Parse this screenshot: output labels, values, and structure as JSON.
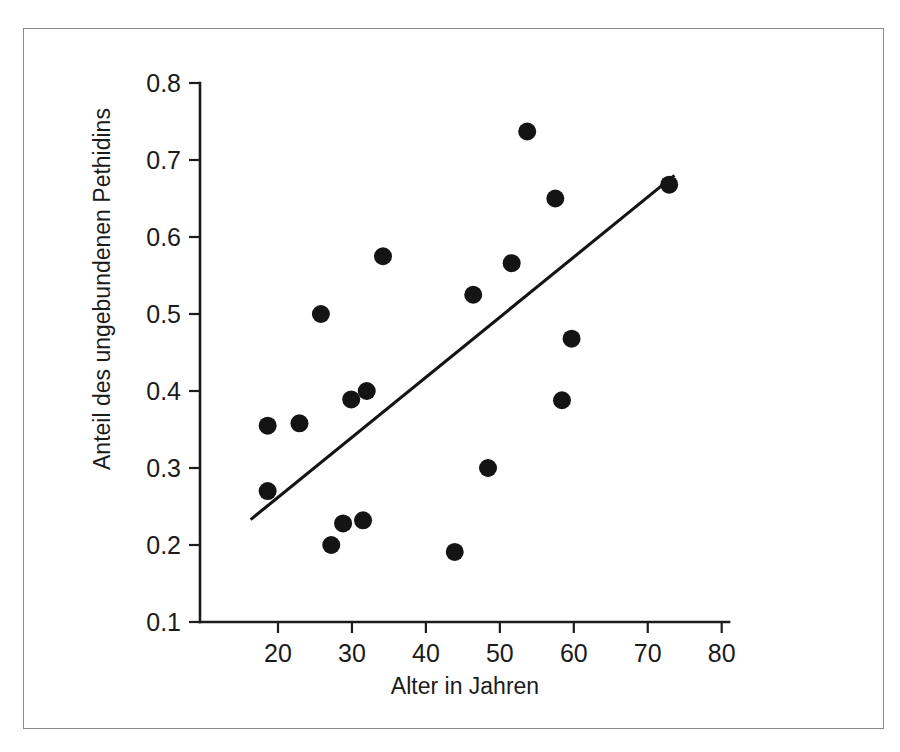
{
  "figure": {
    "border_color": "#8a8a8a",
    "background": "#ffffff"
  },
  "chart_data": {
    "type": "scatter",
    "title": "",
    "xlabel": "Alter in Jahren",
    "ylabel": "Anteil des ungebundenen Pethidins",
    "xlim": [
      13,
      81
    ],
    "ylim": [
      0.1,
      0.8
    ],
    "xticks": [
      20,
      30,
      40,
      50,
      60,
      70,
      80
    ],
    "xtick_labels": [
      "20",
      "30",
      "40",
      "50",
      "60",
      "70",
      "80"
    ],
    "yticks": [
      0.1,
      0.2,
      0.3,
      0.4,
      0.5,
      0.6,
      0.7,
      0.8
    ],
    "ytick_labels": [
      "0.1",
      "0.2",
      "0.3",
      "0.4",
      "0.5",
      "0.6",
      "0.7",
      "0.8"
    ],
    "grid": false,
    "legend": false,
    "marker_color": "#141414",
    "marker_size": 9,
    "points": [
      {
        "x": 18.6,
        "y": 0.355
      },
      {
        "x": 18.6,
        "y": 0.27
      },
      {
        "x": 22.9,
        "y": 0.358
      },
      {
        "x": 25.8,
        "y": 0.5
      },
      {
        "x": 27.2,
        "y": 0.2
      },
      {
        "x": 28.8,
        "y": 0.228
      },
      {
        "x": 29.9,
        "y": 0.389
      },
      {
        "x": 31.5,
        "y": 0.232
      },
      {
        "x": 32.0,
        "y": 0.4
      },
      {
        "x": 34.2,
        "y": 0.575
      },
      {
        "x": 43.9,
        "y": 0.191
      },
      {
        "x": 46.4,
        "y": 0.525
      },
      {
        "x": 48.4,
        "y": 0.3
      },
      {
        "x": 51.6,
        "y": 0.566
      },
      {
        "x": 53.7,
        "y": 0.737
      },
      {
        "x": 57.5,
        "y": 0.65
      },
      {
        "x": 58.4,
        "y": 0.388
      },
      {
        "x": 59.7,
        "y": 0.468
      },
      {
        "x": 72.9,
        "y": 0.668
      }
    ],
    "trend_line": {
      "color": "#141414",
      "x_start": 16.3,
      "y_start": 0.233,
      "x_end": 73.6,
      "y_end": 0.68
    }
  }
}
